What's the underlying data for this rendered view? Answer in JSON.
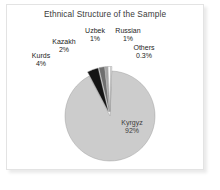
{
  "chart_data": {
    "type": "pie",
    "title": "Ethnical Structure of the Sample",
    "xlabel": "",
    "ylabel": "",
    "legend_position": "none",
    "grid": false,
    "categories": [
      "Kyrgyz",
      "Kurds",
      "Kazakh",
      "Uzbek",
      "Russian",
      "Others"
    ],
    "values": [
      92,
      4,
      2,
      1,
      1,
      0.3
    ],
    "value_labels": [
      "92%",
      "4%",
      "2%",
      "1%",
      "1%",
      "0.3%"
    ],
    "colors": [
      "#cccccc",
      "#141414",
      "#6e6e6e",
      "#a8a8a8",
      "#fbfbfb",
      "#ffffff"
    ],
    "slices": [
      {
        "name": "Kyrgyz",
        "value": 92,
        "label": "Kyrgyz",
        "pct": "92%",
        "color": "#cccccc",
        "exploded": false
      },
      {
        "name": "Kurds",
        "value": 4,
        "label": "Kurds",
        "pct": "4%",
        "color": "#141414",
        "exploded": true
      },
      {
        "name": "Kazakh",
        "value": 2,
        "label": "Kazakh",
        "pct": "2%",
        "color": "#6e6e6e",
        "exploded": true
      },
      {
        "name": "Uzbek",
        "value": 1,
        "label": "Uzbek",
        "pct": "1%",
        "color": "#a8a8a8",
        "exploded": true
      },
      {
        "name": "Russian",
        "value": 1,
        "label": "Russian",
        "pct": "1%",
        "color": "#fbfbfb",
        "exploded": true
      },
      {
        "name": "Others",
        "value": 0.3,
        "label": "Others",
        "pct": "0.3%",
        "color": "#ffffff",
        "exploded": true
      }
    ]
  }
}
